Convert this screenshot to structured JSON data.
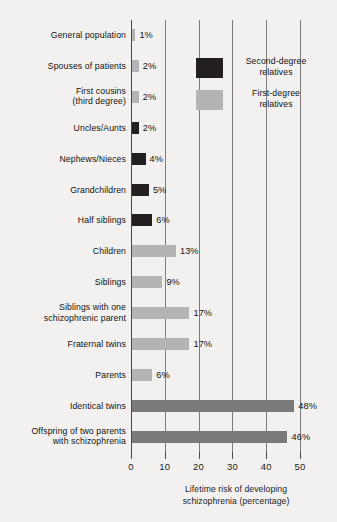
{
  "chart_data": {
    "type": "bar",
    "orientation": "horizontal",
    "title": "",
    "xlabel": "Lifetime risk of developing schizophrenia (percentage)",
    "ylabel": "",
    "xlim": [
      0,
      50
    ],
    "xticks": [
      "0",
      "10",
      "20",
      "30",
      "40",
      "50"
    ],
    "grid": true,
    "legend_position": "upper-right-inset",
    "categories": [
      "General population",
      "Spouses of patients",
      "First cousins (third degree)",
      "Uncles/Aunts",
      "Nephews/Nieces",
      "Grandchildren",
      "Half siblings",
      "Children",
      "Siblings",
      "Siblings with one schizophrenic parent",
      "Fraternal twins",
      "Parents",
      "Identical twins",
      "Offspring of two parents with schizophrenia"
    ],
    "values": [
      1,
      2,
      2,
      2,
      4,
      5,
      6,
      13,
      9,
      17,
      17,
      6,
      48,
      46
    ],
    "value_labels": [
      "1%",
      "2%",
      "2%",
      "2%",
      "4%",
      "5%",
      "6%",
      "13%",
      "9%",
      "17%",
      "17%",
      "6%",
      "48%",
      "46%"
    ],
    "groups": [
      "first-degree",
      "first-degree",
      "first-degree",
      "second-degree",
      "second-degree",
      "second-degree",
      "second-degree",
      "first-degree",
      "first-degree",
      "first-degree",
      "first-degree",
      "first-degree",
      "high-risk",
      "high-risk"
    ],
    "colors": {
      "second_degree": "#231f20",
      "first_degree": "#b4b4b4",
      "high_risk": "#7a7a7a",
      "background": "#f2f1ef",
      "gridline": "#7c7c7c",
      "text": "#111111"
    }
  },
  "rows": [
    {
      "label_line1": "General population",
      "label_line2": "",
      "value": 1,
      "value_label": "1%",
      "group": "first-degree"
    },
    {
      "label_line1": "Spouses of patients",
      "label_line2": "",
      "value": 2,
      "value_label": "2%",
      "group": "first-degree"
    },
    {
      "label_line1": "First cousins",
      "label_line2": "(third degree)",
      "value": 2,
      "value_label": "2%",
      "group": "first-degree"
    },
    {
      "label_line1": "Uncles/Aunts",
      "label_line2": "",
      "value": 2,
      "value_label": "2%",
      "group": "second-degree"
    },
    {
      "label_line1": "Nephews/Nieces",
      "label_line2": "",
      "value": 4,
      "value_label": "4%",
      "group": "second-degree"
    },
    {
      "label_line1": "Grandchildren",
      "label_line2": "",
      "value": 5,
      "value_label": "5%",
      "group": "second-degree"
    },
    {
      "label_line1": "Half siblings",
      "label_line2": "",
      "value": 6,
      "value_label": "6%",
      "group": "second-degree"
    },
    {
      "label_line1": "Children",
      "label_line2": "",
      "value": 13,
      "value_label": "13%",
      "group": "first-degree"
    },
    {
      "label_line1": "Siblings",
      "label_line2": "",
      "value": 9,
      "value_label": "9%",
      "group": "first-degree"
    },
    {
      "label_line1": "Siblings with one",
      "label_line2": "schizophrenic parent",
      "value": 17,
      "value_label": "17%",
      "group": "first-degree"
    },
    {
      "label_line1": "Fraternal twins",
      "label_line2": "",
      "value": 17,
      "value_label": "17%",
      "group": "first-degree"
    },
    {
      "label_line1": "Parents",
      "label_line2": "",
      "value": 6,
      "value_label": "6%",
      "group": "first-degree"
    },
    {
      "label_line1": "Identical twins",
      "label_line2": "",
      "value": 48,
      "value_label": "48%",
      "group": "high-risk"
    },
    {
      "label_line1": "Offspring of two parents",
      "label_line2": "with schizophrenia",
      "value": 46,
      "value_label": "46%",
      "group": "high-risk"
    }
  ],
  "legend": {
    "entries": [
      {
        "label_line1": "Second-degree",
        "label_line2": "relatives",
        "swatch": "second-degree"
      },
      {
        "label_line1": "First-degree",
        "label_line2": "relatives",
        "swatch": "first-degree"
      }
    ]
  },
  "axis": {
    "ticks": [
      "0",
      "10",
      "20",
      "30",
      "40",
      "50"
    ],
    "title_line1": "Lifetime risk of developing",
    "title_line2": "schizophrenia (percentage)"
  }
}
